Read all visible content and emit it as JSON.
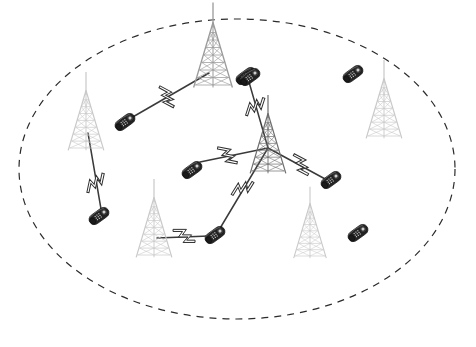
{
  "diagram": {
    "background_color": "#ffffff",
    "width": 476,
    "height": 347
  },
  "coverage_area": {
    "name": "coverage-boundary",
    "shape": "ellipse",
    "cx": 237,
    "cy": 169,
    "rx": 218,
    "ry": 150,
    "stroke_color": "#2b2b2b",
    "stroke_width": 1.2,
    "dash_pattern": "7 6",
    "fill": "none"
  },
  "palette": {
    "tower_dark": "#6e6e6e",
    "tower_light": "#c9c9c9",
    "tower_mid": "#9a9a9a",
    "phone_body": "#2a2a2a",
    "phone_highlight": "#d8d8d8",
    "link_line": "#3a3a3a",
    "bolt_fill": "#ffffff",
    "bolt_stroke": "#333333",
    "boundary": "#2b2b2b"
  },
  "towers": [
    {
      "id": "tower-hub-center",
      "label": "Central base station",
      "x": 268,
      "y": 148,
      "scale": 1.15,
      "tone": "dark",
      "role": "hub"
    },
    {
      "id": "tower-upper-left",
      "label": "Base station upper-left",
      "x": 213,
      "y": 60,
      "scale": 1.25,
      "tone": "mid",
      "role": "relay"
    },
    {
      "id": "tower-left",
      "label": "Base station left",
      "x": 86,
      "y": 125,
      "scale": 1.15,
      "tone": "light",
      "role": "relay"
    },
    {
      "id": "tower-right",
      "label": "Base station right",
      "x": 384,
      "y": 113,
      "scale": 1.15,
      "tone": "light",
      "role": "idle"
    },
    {
      "id": "tower-lower-left",
      "label": "Base station lower-left",
      "x": 154,
      "y": 232,
      "scale": 1.15,
      "tone": "light",
      "role": "relay"
    },
    {
      "id": "tower-lower-right",
      "label": "Base station lower-right",
      "x": 310,
      "y": 235,
      "scale": 1.05,
      "tone": "light",
      "role": "idle"
    }
  ],
  "handsets": [
    {
      "id": "phone-nw",
      "label": "Mobile handset north-west",
      "x": 125,
      "y": 122,
      "rot": -36,
      "scale": 1.0,
      "connected": true
    },
    {
      "id": "phone-ne-top",
      "label": "Mobile handset north-east",
      "x": 246,
      "y": 76,
      "rot": -36,
      "scale": 1.0,
      "connected": true
    },
    {
      "id": "phone-far-ne",
      "label": "Mobile handset far north-east",
      "x": 353,
      "y": 74,
      "rot": -36,
      "scale": 1.0,
      "connected": false
    },
    {
      "id": "phone-mid-left",
      "label": "Mobile handset mid-left",
      "x": 192,
      "y": 170,
      "rot": -36,
      "scale": 1.0,
      "connected": true
    },
    {
      "id": "phone-east",
      "label": "Mobile handset east",
      "x": 331,
      "y": 180,
      "rot": -36,
      "scale": 1.0,
      "connected": true
    },
    {
      "id": "phone-west",
      "label": "Mobile handset west",
      "x": 99,
      "y": 216,
      "rot": -36,
      "scale": 1.0,
      "connected": true
    },
    {
      "id": "phone-south",
      "label": "Mobile handset south",
      "x": 215,
      "y": 235,
      "rot": -36,
      "scale": 1.0,
      "connected": true
    },
    {
      "id": "phone-far-se",
      "label": "Mobile handset far south-east",
      "x": 358,
      "y": 233,
      "rot": -36,
      "scale": 1.0,
      "connected": false
    },
    {
      "id": "phone-ne-tower",
      "label": "Mobile handset near upper tower",
      "x": 250,
      "y": 77,
      "rot": -36,
      "scale": 1.0,
      "connected": true
    }
  ],
  "links": [
    {
      "id": "link-hub-to-phone-ne",
      "label": "Radio link hub to north-east handset",
      "x1": 268,
      "y1": 148,
      "x2": 249,
      "y2": 82,
      "bolt_t": 0.62,
      "bolt_rot": -72
    },
    {
      "id": "link-hub-to-phone-east",
      "label": "Radio link hub to east handset",
      "x1": 268,
      "y1": 148,
      "x2": 327,
      "y2": 180,
      "bolt_t": 0.55,
      "bolt_rot": 28
    },
    {
      "id": "link-hub-to-phone-midleft",
      "label": "Radio link hub to mid-left handset",
      "x1": 268,
      "y1": 148,
      "x2": 200,
      "y2": 162,
      "bolt_t": 0.6,
      "bolt_rot": 11
    },
    {
      "id": "link-hub-to-phone-south",
      "label": "Radio link hub to south handset",
      "x1": 268,
      "y1": 148,
      "x2": 219,
      "y2": 230,
      "bolt_t": 0.5,
      "bolt_rot": -58
    },
    {
      "id": "link-uptower-to-phone-nw",
      "label": "Radio link upper tower to north-west handset",
      "x1": 209,
      "y1": 73,
      "x2": 131,
      "y2": 118,
      "bolt_t": 0.55,
      "bolt_rot": 28
    },
    {
      "id": "link-lefttower-to-phone-west",
      "label": "Radio link left tower to west handset",
      "x1": 88,
      "y1": 133,
      "x2": 101,
      "y2": 209,
      "bolt_t": 0.66,
      "bolt_rot": -78
    },
    {
      "id": "link-lowertower-to-phone-south",
      "label": "Radio link lower-left tower to south handset",
      "x1": 157,
      "y1": 238,
      "x2": 209,
      "y2": 236,
      "bolt_t": 0.52,
      "bolt_rot": 0
    }
  ],
  "legend_semantics": {
    "tower": "cell-tower-icon",
    "handset": "mobile-phone-icon",
    "bolt": "lightning-bolt-icon",
    "boundary": "dashed-ellipse-coverage"
  }
}
